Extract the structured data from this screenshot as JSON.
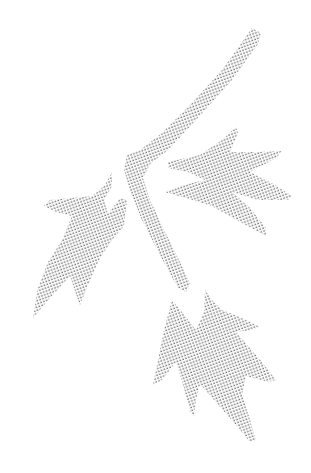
{
  "image": {
    "subject": "Halftone-dot illustration of a branch with three leaves",
    "background_color": "#ffffff",
    "dot_color": "#5a5a5a",
    "dot_spacing_px": 3,
    "elements": [
      {
        "name": "branch",
        "label": "Branch"
      },
      {
        "name": "leaf-right",
        "label": "Upper right leaf"
      },
      {
        "name": "leaf-left",
        "label": "Left leaf"
      },
      {
        "name": "leaf-bottom",
        "label": "Bottom leaf"
      }
    ]
  }
}
